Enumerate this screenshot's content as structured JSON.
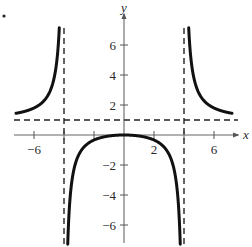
{
  "chart_data": {
    "type": "line",
    "title": "",
    "xlabel": "x",
    "ylabel": "y",
    "xlim": [
      -7.5,
      7.5
    ],
    "ylim": [
      -7.5,
      7.5
    ],
    "grid": false,
    "x_ticks": [
      -6,
      -4,
      -2,
      2,
      4,
      6
    ],
    "x_tick_labels": [
      "-6",
      "2",
      "6"
    ],
    "y_ticks": [
      -6,
      -4,
      -2,
      2,
      4,
      6
    ],
    "y_tick_labels": [
      "6",
      "4",
      "2",
      "-2",
      "-4",
      "-6"
    ],
    "function": "y = x^2 / (x^2 - 16)",
    "asymptotes": {
      "vertical": [
        -4,
        4
      ],
      "horizontal": [
        1
      ]
    },
    "series": [
      {
        "name": "left branch",
        "x": [
          -7,
          -6.5,
          -6,
          -5.5,
          -5,
          -4.6,
          -4.3,
          -4.15
        ],
        "y": [
          1.48,
          1.61,
          1.8,
          2.12,
          2.78,
          4.05,
          7.2,
          13.6
        ]
      },
      {
        "name": "middle branch",
        "x": [
          -3.9,
          -3.7,
          -3.5,
          -3,
          -2,
          -1,
          0,
          1,
          2,
          3,
          3.5,
          3.7,
          3.9
        ],
        "y": [
          -19.3,
          -5.9,
          -4.27,
          -1.29,
          -0.33,
          -0.07,
          0,
          -0.07,
          -0.33,
          -1.29,
          -4.27,
          -5.9,
          -19.3
        ]
      },
      {
        "name": "right branch",
        "x": [
          4.15,
          4.3,
          4.6,
          5,
          5.5,
          6,
          6.5,
          7
        ],
        "y": [
          13.6,
          7.2,
          4.05,
          2.78,
          2.12,
          1.8,
          1.61,
          1.48
        ]
      }
    ]
  },
  "labels": {
    "x_axis": "x",
    "y_axis": "y",
    "x_neg6": "−6",
    "x_2": "2",
    "x_6": "6",
    "y_6": "6",
    "y_4": "4",
    "y_2": "2",
    "y_neg2": "−2",
    "y_neg4": "−4",
    "y_neg6": "−6"
  }
}
